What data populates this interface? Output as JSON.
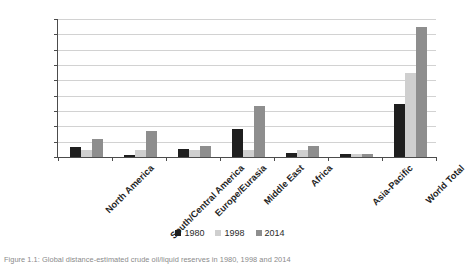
{
  "chart_data": {
    "type": "bar",
    "title": "",
    "xlabel": "",
    "ylabel": "",
    "ylim": [
      0,
      1800
    ],
    "ytick_step": 200,
    "yticks": [
      0,
      200,
      400,
      600,
      800,
      1000,
      1200,
      1400,
      1600,
      1800
    ],
    "grid": true,
    "legend_position": "bottom-center",
    "categories": [
      "North America",
      "South/Central America",
      "Europe/Eurasia",
      "Middle East",
      "Africa",
      "Asia-Pacific",
      "World Total"
    ],
    "series": [
      {
        "name": "1980",
        "color": "#1f1f1f",
        "values": [
          130,
          25,
          100,
          370,
          55,
          40,
          690
        ]
      },
      {
        "name": "1998",
        "color": "#cfcfcf",
        "values": [
          90,
          95,
          95,
          95,
          90,
          45,
          1090
        ]
      },
      {
        "name": "2014",
        "color": "#8e8e8e",
        "values": [
          230,
          340,
          150,
          670,
          145,
          45,
          1700
        ]
      }
    ]
  },
  "axis": {
    "y_tick_labels": [
      "1800",
      "1600",
      "1400",
      "1200",
      "1000",
      "800",
      "600",
      "400",
      "200",
      "0"
    ]
  },
  "legend": {
    "items": [
      {
        "label": "1980",
        "color": "#1f1f1f"
      },
      {
        "label": "1998",
        "color": "#cfcfcf"
      },
      {
        "label": "2014",
        "color": "#8e8e8e"
      }
    ]
  },
  "caption": {
    "text": "Figure 1.1: Global distance-estimated crude oil/liquid reserves in 1980, 1998 and 2014"
  },
  "colors": {
    "axis": "#4c4c4c",
    "gridline": "#d2d2d2",
    "background": "#ffffff"
  }
}
